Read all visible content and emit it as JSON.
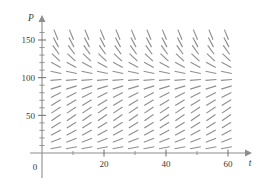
{
  "figure": {
    "kind": "slope-field",
    "background_color": "#ffffff",
    "axis_color": "#8d8d8d",
    "segment_color": "#8f8f93",
    "label_color": "#3a3a3a"
  },
  "chart_data": {
    "type": "scatter",
    "subtype": "slope-field",
    "title": "",
    "xlabel": "t",
    "ylabel": "P",
    "xlim": [
      0,
      64
    ],
    "ylim": [
      0,
      164
    ],
    "grid": false,
    "legend": null,
    "x_ticks": [
      {
        "value": 0,
        "label": "0"
      },
      {
        "value": 20,
        "label": "20"
      },
      {
        "value": 40,
        "label": "40"
      },
      {
        "value": 60,
        "label": "60"
      }
    ],
    "x_minor_ticks": [
      10,
      30,
      50
    ],
    "y_ticks": [
      {
        "value": 50,
        "label": "50"
      },
      {
        "value": 100,
        "label": "100"
      },
      {
        "value": 150,
        "label": "150"
      }
    ],
    "y_minor_ticks": [
      10,
      20,
      30,
      40,
      60,
      70,
      80,
      90,
      110,
      120,
      130,
      140,
      160
    ],
    "origin_label": "0",
    "axis_arrows": {
      "x": true,
      "y": true
    },
    "field": {
      "equation_form": "dP/dt = k*P*(1 - P/M)",
      "carrying_capacity": 100,
      "growth_rate": 0.05,
      "x_samples": [
        4.5,
        9.5,
        14.5,
        19.5,
        24.5,
        29.5,
        34.5,
        39.5,
        44.5,
        49.5,
        54.5,
        59.5
      ],
      "y_samples": [
        7,
        17,
        27,
        37,
        47,
        57,
        67,
        77,
        87,
        97,
        107,
        117,
        127,
        137,
        147,
        157
      ],
      "segment_length_px": 11,
      "slope_scale": 0.55,
      "note": "Slopes are steeply negative above P=100, near zero at P=100, and gently positive below P=100; slopes are independent of t (autonomous equation)."
    }
  }
}
